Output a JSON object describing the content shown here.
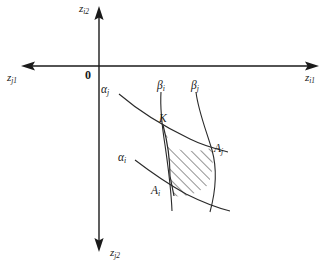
{
  "figure": {
    "type": "diagram",
    "background_color": "#ffffff",
    "line_color": "#2a2a2a",
    "axis_color": "#1a1a1a",
    "width": 332,
    "height": 270
  },
  "axes": {
    "origin_label": "0",
    "vertical_up": {
      "name": "z-i2-axis",
      "label_main": "z",
      "label_sub": "i2",
      "arrow_direction": "up"
    },
    "vertical_down": {
      "name": "z-j2-axis",
      "label_main": "z",
      "label_sub": "j2",
      "arrow_direction": "down"
    },
    "horizontal_left": {
      "name": "z-j1-axis",
      "label_main": "z",
      "label_sub": "j1",
      "arrow_direction": "left"
    },
    "horizontal_right": {
      "name": "z-i1-axis",
      "label_main": "z",
      "label_sub": "i1",
      "arrow_direction": "right"
    }
  },
  "curves": [
    {
      "id": "alpha-j",
      "label_main": "α",
      "label_sub": "j"
    },
    {
      "id": "alpha-i",
      "label_main": "α",
      "label_sub": "i"
    },
    {
      "id": "beta-i",
      "label_main": "β",
      "label_sub": "i"
    },
    {
      "id": "beta-j",
      "label_main": "β",
      "label_sub": "j"
    }
  ],
  "points": [
    {
      "id": "K",
      "label_main": "K",
      "label_sub": ""
    },
    {
      "id": "A-i",
      "label_main": "A",
      "label_sub": "i"
    },
    {
      "id": "A-j",
      "label_main": "A",
      "label_sub": "j"
    }
  ],
  "region": {
    "id": "feasible-region",
    "fill_style": "diagonal-hatch",
    "hatch_color": "#2a2a2a"
  }
}
